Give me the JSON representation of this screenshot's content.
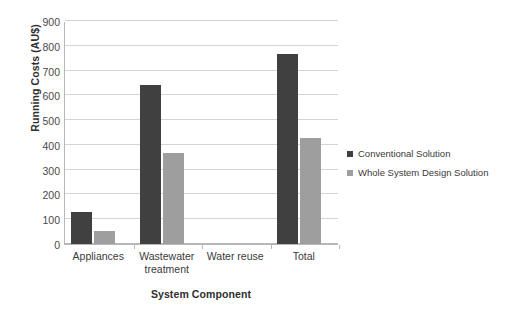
{
  "chart_data": {
    "type": "bar",
    "title": "",
    "xlabel": "System Component",
    "ylabel": "Running Costs (AU$)",
    "categories": [
      "Appliances",
      "Wastewater treatment",
      "Water reuse",
      "Total"
    ],
    "category_lines": [
      [
        "Appliances"
      ],
      [
        "Wastewater",
        "treatment"
      ],
      [
        "Water reuse"
      ],
      [
        "Total"
      ]
    ],
    "series": [
      {
        "name": "Conventional Solution",
        "color": "#404040",
        "values": [
          128,
          641,
          0,
          767
        ]
      },
      {
        "name": "Whole System Design Solution",
        "color": "#9e9e9e",
        "values": [
          52,
          367,
          0,
          428
        ]
      }
    ],
    "ylim": [
      0,
      900
    ],
    "ytick_step": 100,
    "yticks": [
      900,
      800,
      700,
      600,
      500,
      400,
      300,
      200,
      100,
      0
    ],
    "ytick_labels": [
      "900",
      "800",
      "700",
      "600",
      "500",
      "400",
      "300",
      "200",
      "100",
      "0"
    ],
    "grid": true,
    "legend_position": "right",
    "background": "#ffffff",
    "gridline_color": "#d4d4d4",
    "axis_color": "#b8b8b8"
  }
}
